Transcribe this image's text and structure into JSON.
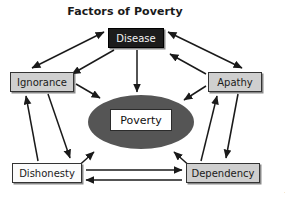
{
  "title": "Factors of Poverty",
  "copyright": "©2013 Cengage Learning",
  "nodes": {
    "disease": {
      "label": "Disease",
      "fill": "#1c1c1c",
      "text_color": "#f2f2f2"
    },
    "ignorance": {
      "label": "Ignorance",
      "fill": "#cfcfcf",
      "text_color": "#1a1a1a"
    },
    "apathy": {
      "label": "Apathy",
      "fill": "#cfcfcf",
      "text_color": "#1a1a1a"
    },
    "dishonesty": {
      "label": "Dishonesty",
      "fill": "#fbfbfb",
      "text_color": "#1a1a1a"
    },
    "dependency": {
      "label": "Dependency",
      "fill": "#cfcfcf",
      "text_color": "#1a1a1a"
    },
    "center": {
      "label": "Poverty",
      "ellipse_fill": "#555555",
      "box_fill": "#ffffff",
      "text_color": "#111111"
    }
  },
  "relationships": [
    {
      "from": "ignorance",
      "to": "disease",
      "direction": "both"
    },
    {
      "from": "disease",
      "to": "apathy",
      "direction": "both"
    },
    {
      "from": "disease",
      "to": "poverty",
      "direction": "to"
    },
    {
      "from": "ignorance",
      "to": "poverty",
      "direction": "to"
    },
    {
      "from": "apathy",
      "to": "poverty",
      "direction": "to"
    },
    {
      "from": "dishonesty",
      "to": "poverty",
      "direction": "to"
    },
    {
      "from": "dependency",
      "to": "poverty",
      "direction": "to"
    },
    {
      "from": "dishonesty",
      "to": "ignorance",
      "direction": "to"
    },
    {
      "from": "ignorance",
      "to": "dishonesty",
      "direction": "to"
    },
    {
      "from": "dependency",
      "to": "apathy",
      "direction": "to"
    },
    {
      "from": "apathy",
      "to": "dependency",
      "direction": "to"
    },
    {
      "from": "dishonesty",
      "to": "dependency",
      "direction": "to"
    },
    {
      "from": "dependency",
      "to": "dishonesty",
      "direction": "to"
    }
  ],
  "colors": {
    "background": "#ffffff",
    "arrow": "#1a1a1a",
    "border": "#333333"
  }
}
